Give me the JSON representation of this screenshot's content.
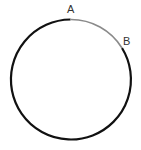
{
  "diagram": {
    "type": "circle-arc",
    "labels": {
      "point_a": "A",
      "point_b": "B"
    },
    "colors": {
      "major_arc": "#111111",
      "minor_arc": "#8a8a8a",
      "label": "#333333"
    }
  }
}
